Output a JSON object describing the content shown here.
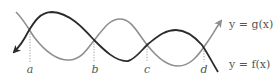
{
  "diagram": {
    "title": "",
    "curves": [
      {
        "name": "f",
        "label": "y = f(x)",
        "color": "#2b2b2b"
      },
      {
        "name": "g",
        "label": "y = g(x)",
        "color": "#8f8f8f"
      }
    ],
    "intersections": [
      {
        "label": "a",
        "x": 30,
        "y": 30
      },
      {
        "label": "b",
        "x": 94,
        "y": 40
      },
      {
        "label": "c",
        "x": 147,
        "y": 45
      },
      {
        "label": "d",
        "x": 204,
        "y": 47
      }
    ],
    "labels": {
      "a": "a",
      "b": "b",
      "c": "c",
      "d": "d",
      "g_eq": "y = g(x)",
      "f_eq": "y = f(x)"
    }
  }
}
